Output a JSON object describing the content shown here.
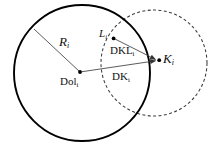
{
  "figure": {
    "type": "geometry-diagram",
    "width": 221,
    "height": 149,
    "background_color": "#ffffff",
    "stroke_color": "#000000",
    "thin_stroke_color": "#555555"
  },
  "shapes": {
    "solid_circle": {
      "name": "main-solid-circle",
      "cx": 82,
      "cy": 73,
      "r": 68,
      "stroke": "#000000",
      "stroke_width": 1.8,
      "dashed": false
    },
    "dashed_circle": {
      "name": "secondary-dashed-circle",
      "cx": 154,
      "cy": 63,
      "r": 53,
      "stroke": "#333333",
      "stroke_width": 1.1,
      "dashed": true,
      "dash_pattern": "3,2.4"
    }
  },
  "points": {
    "center": {
      "name": "Dol-point",
      "x": 80,
      "y": 72
    },
    "l_point": {
      "name": "L-point",
      "x": 114,
      "y": 38
    },
    "k_point": {
      "name": "K-point",
      "x": 159,
      "y": 60
    },
    "radius_end": {
      "name": "radius-endpoint",
      "x": 34,
      "y": 29
    }
  },
  "segments": [
    {
      "name": "radius-segment",
      "from": "radius_end",
      "to": "center",
      "label": "R"
    },
    {
      "name": "dol-to-k-segment",
      "from": "center",
      "to": "k_point",
      "arrow": true,
      "label": "DK"
    },
    {
      "name": "l-to-k-segment",
      "from": "l_point",
      "to": "k_point",
      "arrow": true,
      "label": "DKL"
    }
  ],
  "labels": {
    "radius": {
      "base": "R",
      "sub": "i",
      "x": 59,
      "y": 41,
      "italic": true
    },
    "center": {
      "base": "Dol",
      "sub": "i",
      "x": 62,
      "y": 80,
      "italic": false
    },
    "l_vertex": {
      "base": "L",
      "sub": "i",
      "x": 99,
      "y": 29,
      "italic": true
    },
    "k_vertex": {
      "base": "K",
      "sub": "i",
      "x": 163,
      "y": 54,
      "italic": true
    },
    "dkl": {
      "base": "DKL",
      "sub": "i",
      "x": 110,
      "y": 45,
      "italic": false
    },
    "dk": {
      "base": "DK",
      "sub": "i",
      "x": 112,
      "y": 71,
      "italic": false
    }
  }
}
